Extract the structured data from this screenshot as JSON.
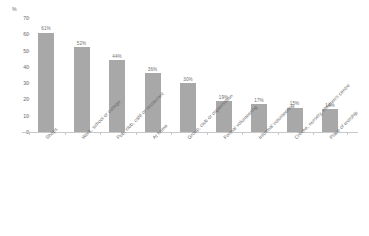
{
  "chart_data": {
    "type": "bar",
    "title": "",
    "subtitle": "",
    "xlabel": "",
    "ylabel": "%",
    "ylim": [
      0,
      70
    ],
    "ytick_values": [
      0,
      10,
      20,
      30,
      40,
      50,
      60,
      70
    ],
    "ytick_labels": [
      "0",
      "10",
      "20",
      "30",
      "40",
      "50",
      "60",
      "70"
    ],
    "grid": false,
    "legend": false,
    "bar_color": "#a8a8a8",
    "axis_color": "#c9c9c9",
    "text_color": "#6a6a6a",
    "categories": [
      "Shops",
      "Work, school or college",
      "Pub, club, café or restaurant",
      "At home",
      "Group, club or organisation",
      "Formal volunteering",
      "Informal volunteering",
      "Crèche, nursery, children's centre",
      "Place of worship"
    ],
    "values": [
      61,
      52,
      44,
      36,
      30,
      19,
      17,
      15,
      14
    ],
    "value_labels": [
      "61%",
      "52%",
      "44%",
      "36%",
      "30%",
      "19%",
      "17%",
      "15%",
      "14%"
    ]
  }
}
